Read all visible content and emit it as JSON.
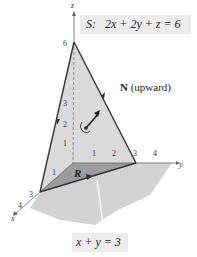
{
  "surface_label": {
    "name": "S:",
    "equation": "2x + 2y + z = 6"
  },
  "normal_label": {
    "bold": "N",
    "text": "(upward)"
  },
  "region_label": "R",
  "line_label": "x + y = 3",
  "axes": {
    "x": {
      "label": "x",
      "ticks": [
        "1",
        "3",
        "4"
      ]
    },
    "y": {
      "label": "y",
      "ticks": [
        "1",
        "2",
        "3",
        "4"
      ]
    },
    "z": {
      "label": "z",
      "ticks": [
        "1",
        "2",
        "3",
        "6"
      ]
    }
  },
  "colors": {
    "surface_fill": "#d9d9d9",
    "region_fill": "#9a9a9a",
    "plane_fill": "#cfcfcf",
    "edge": "#333333",
    "label_bg": "#ececec"
  }
}
